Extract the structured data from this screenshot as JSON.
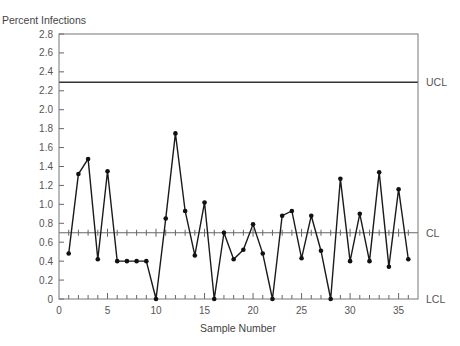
{
  "chart_data": {
    "type": "line",
    "title": "",
    "ylabel": "Percent Infections",
    "xlabel": "Sample Number",
    "xlim": [
      0,
      37
    ],
    "ylim": [
      0,
      2.8
    ],
    "x_ticks": [
      0,
      5,
      10,
      15,
      20,
      25,
      30,
      35
    ],
    "x_minor_step": 1,
    "y_ticks": [
      0,
      0.2,
      0.4,
      0.6,
      0.8,
      1.0,
      1.2,
      1.4,
      1.6,
      1.8,
      2.0,
      2.2,
      2.4,
      2.6,
      2.8
    ],
    "y_tick_labels": [
      "0",
      "0.2",
      "0.4",
      "0.6",
      "0.8",
      "1.0",
      "1.2",
      "1.4",
      "1.6",
      "1.8",
      "2.0",
      "2.2",
      "2.4",
      "2.6",
      "2.8"
    ],
    "grid": false,
    "control_limits": [
      {
        "name": "UCL",
        "value": 2.29
      },
      {
        "name": "CL",
        "value": 0.7
      },
      {
        "name": "LCL",
        "value": 0
      }
    ],
    "series": [
      {
        "name": "Percent Infections",
        "x": [
          1,
          2,
          3,
          4,
          5,
          6,
          7,
          8,
          9,
          10,
          11,
          12,
          13,
          14,
          15,
          16,
          17,
          18,
          19,
          20,
          21,
          22,
          23,
          24,
          25,
          26,
          27,
          28,
          29,
          30,
          31,
          32,
          33,
          34,
          35,
          36
        ],
        "values": [
          0.48,
          1.32,
          1.48,
          0.42,
          1.35,
          0.4,
          0.4,
          0.4,
          0.4,
          0.0,
          0.85,
          1.75,
          0.93,
          0.46,
          1.02,
          0.0,
          0.7,
          0.42,
          0.52,
          0.79,
          0.48,
          0.0,
          0.88,
          0.93,
          0.43,
          0.88,
          0.51,
          0.0,
          1.27,
          0.4,
          0.9,
          0.4,
          1.34,
          0.34,
          1.16,
          0.42
        ]
      }
    ]
  }
}
